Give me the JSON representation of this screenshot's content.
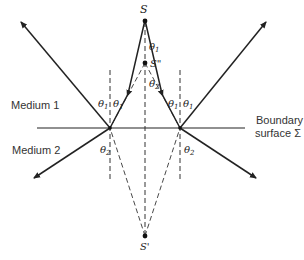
{
  "diagram": {
    "type": "ray-optics-reflection-refraction",
    "labels": {
      "source": "S",
      "virtual_image_reflection": "S\"",
      "virtual_image_refraction": "S'",
      "medium1": "Medium 1",
      "medium2": "Medium 2",
      "boundary_line1": "Boundary",
      "boundary_line2": "surface Σ",
      "theta1": "θ",
      "theta1_sub": "1",
      "theta2": "θ",
      "theta2_sub": "2"
    },
    "colors": {
      "line": "#222222",
      "dashed": "#333333",
      "background": "#ffffff"
    }
  }
}
